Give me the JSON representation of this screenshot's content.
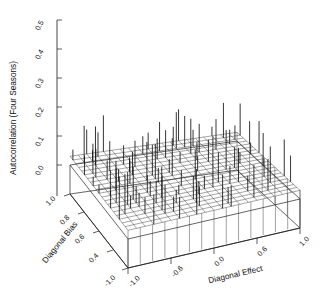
{
  "figure": {
    "kind": "3d-needle-mesh-surface",
    "background": "#ffffff",
    "ink_color": "#1a1a1a"
  },
  "chart_data": {
    "type": "scatter",
    "title": "",
    "subtitle": "",
    "projection": "3d",
    "zlabel": "Autocorrelation (Four Seasons)",
    "xlabel": "Diagonal Effect",
    "ylabel": "Diagonal Bias",
    "zlim": [
      0.0,
      0.5
    ],
    "z_ticks": [
      "0.0",
      "0.1",
      "0.2",
      "0.3",
      "0.4",
      "0.5"
    ],
    "z_tick_values": [
      0.0,
      0.1,
      0.2,
      0.3,
      0.4,
      0.5
    ],
    "xlim": [
      -1.0,
      1.0
    ],
    "x_ticks": [
      "-1.0",
      "-0.6",
      "0.0",
      "0.6",
      "1.0"
    ],
    "x_tick_values": [
      -1.0,
      -0.6,
      0.0,
      0.6,
      1.0
    ],
    "ylim": [
      -1.0,
      1.0
    ],
    "y_ticks": [
      "1.0",
      "0.8",
      "0.6",
      "0.4",
      "-1.0"
    ],
    "y_tick_values": [
      1.0,
      0.8,
      0.6,
      0.4,
      -1.0
    ],
    "grid": true,
    "legend": false,
    "grid_nx": 21,
    "grid_ny": 21,
    "surface_base_z": 0.03,
    "needle_note": "vertical needles rise from a near-flat mesh surface; tallest spikes reach about 0.20",
    "needle_max": 0.2,
    "series": [
      {
        "name": "Autocorrelation (Four Seasons)",
        "values": [
          0.03,
          0.03,
          0.03,
          0.04,
          0.03,
          0.03,
          0.05,
          0.03,
          0.03,
          0.04,
          0.03,
          0.03,
          0.06,
          0.03,
          0.03,
          0.04,
          0.03,
          0.03,
          0.05,
          0.03,
          0.03,
          0.03,
          0.04,
          0.03,
          0.03,
          0.05,
          0.03,
          0.03,
          0.04,
          0.03,
          0.03,
          0.07,
          0.03,
          0.03,
          0.04,
          0.03,
          0.03,
          0.05,
          0.03,
          0.03,
          0.04,
          0.03,
          0.05,
          0.03,
          0.03,
          0.04,
          0.03,
          0.03,
          0.06,
          0.03,
          0.03,
          0.04,
          0.03,
          0.03,
          0.05,
          0.03,
          0.03,
          0.04,
          0.03,
          0.03,
          0.06,
          0.03,
          0.03,
          0.03,
          0.03,
          0.06,
          0.03,
          0.03,
          0.04,
          0.03,
          0.03,
          0.05,
          0.03,
          0.03,
          0.04,
          0.03,
          0.03,
          0.08,
          0.03,
          0.03,
          0.04,
          0.03,
          0.03,
          0.05,
          0.04,
          0.03,
          0.03,
          0.05,
          0.03,
          0.03,
          0.04,
          0.03,
          0.03,
          0.06,
          0.03,
          0.03,
          0.04,
          0.03,
          0.03,
          0.05,
          0.03,
          0.03,
          0.04,
          0.03,
          0.03
        ]
      }
    ]
  },
  "axes": {
    "z": {
      "label": "Autocorrelation (Four Seasons)",
      "ticks": [
        "0.5",
        "0.4",
        "0.3",
        "0.2",
        "0.1",
        "0.0"
      ]
    },
    "x": {
      "label": "Diagonal Effect",
      "ticks": [
        "-1.0",
        "-0.6",
        "0.0",
        "0.6",
        "1.0"
      ]
    },
    "y": {
      "label": "Diagonal Bias",
      "ticks": [
        "1.0",
        "0.8",
        "0.6",
        "0.4",
        "-1.0"
      ]
    }
  }
}
